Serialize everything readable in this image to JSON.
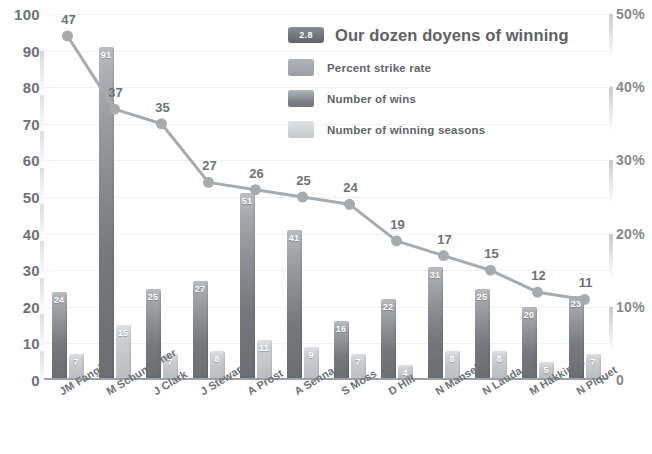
{
  "chart_data": {
    "type": "bar",
    "title": "Our dozen doyens of winning",
    "badge": "2.8",
    "xlabel": "",
    "ylabel": "",
    "grid": true,
    "legend_position": "top-right",
    "ylim": [
      0,
      100
    ],
    "y_ticks": [
      "0",
      "10",
      "20",
      "30",
      "40",
      "50",
      "60",
      "70",
      "80",
      "90",
      "100"
    ],
    "y2lim": [
      0,
      50
    ],
    "y2_ticks": [
      "0",
      "10%",
      "20%",
      "30%",
      "40%",
      "50%"
    ],
    "categories": [
      "JM Fangio",
      "M Schumacher",
      "J Clark",
      "J Stewart",
      "A Prost",
      "A Senna",
      "S Moss",
      "D Hill",
      "N Mansell",
      "N Lauda",
      "M Häkkinen",
      "N Piquet"
    ],
    "series": [
      {
        "name": "Percent strike rate",
        "type": "line",
        "axis": "right",
        "color": "#9aa0a6",
        "values": [
          47,
          37,
          35,
          27,
          26,
          25,
          24,
          19,
          17,
          15,
          12,
          11
        ]
      },
      {
        "name": "Number of wins",
        "type": "bar",
        "axis": "left",
        "color": "#7d8185",
        "values": [
          24,
          91,
          25,
          27,
          51,
          41,
          16,
          22,
          31,
          25,
          20,
          23
        ]
      },
      {
        "name": "Number of winning seasons",
        "type": "bar",
        "axis": "left",
        "color": "#c9ccd0",
        "values": [
          7,
          15,
          7,
          8,
          11,
          9,
          7,
          4,
          8,
          8,
          5,
          7
        ]
      }
    ]
  },
  "legend": {
    "title_badge": "2.8",
    "title_text": "Our dozen doyens of winning",
    "items": [
      {
        "label": "Percent strike rate"
      },
      {
        "label": "Number of wins"
      },
      {
        "label": "Number of winning seasons"
      }
    ]
  }
}
